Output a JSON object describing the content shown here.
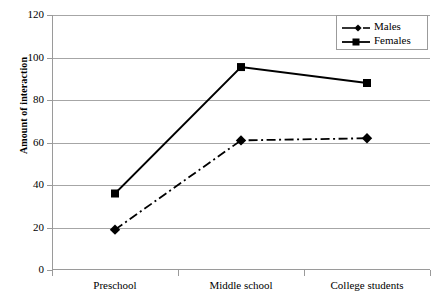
{
  "chart_data": {
    "type": "line",
    "title": "",
    "xlabel": "",
    "ylabel": "Amount of interaction",
    "categories": [
      "Preschool",
      "Middle school",
      "College students"
    ],
    "ylim": [
      0,
      120
    ],
    "yticks": [
      0,
      20,
      40,
      60,
      80,
      100,
      120
    ],
    "grid": true,
    "legend_position": "top-right",
    "series": [
      {
        "name": "Males",
        "values": [
          19,
          61,
          62
        ],
        "marker": "diamond",
        "linestyle": "dash-dot",
        "color": "#000000"
      },
      {
        "name": "Females",
        "values": [
          36,
          95.5,
          88
        ],
        "marker": "square",
        "linestyle": "solid",
        "color": "#000000"
      }
    ]
  },
  "axis": {
    "y_title": "Amount of interaction",
    "y_tick_labels": [
      "120",
      "100",
      "80",
      "60",
      "40",
      "20",
      "0"
    ],
    "x_tick_labels": [
      "Preschool",
      "Middle school",
      "College students"
    ]
  },
  "legend": {
    "entries": [
      {
        "label": "Males"
      },
      {
        "label": "Females"
      }
    ]
  },
  "colors": {
    "series": "#000000",
    "grid": "#a6a6a6",
    "axis": "#9a9a9a",
    "background": "#ffffff"
  }
}
